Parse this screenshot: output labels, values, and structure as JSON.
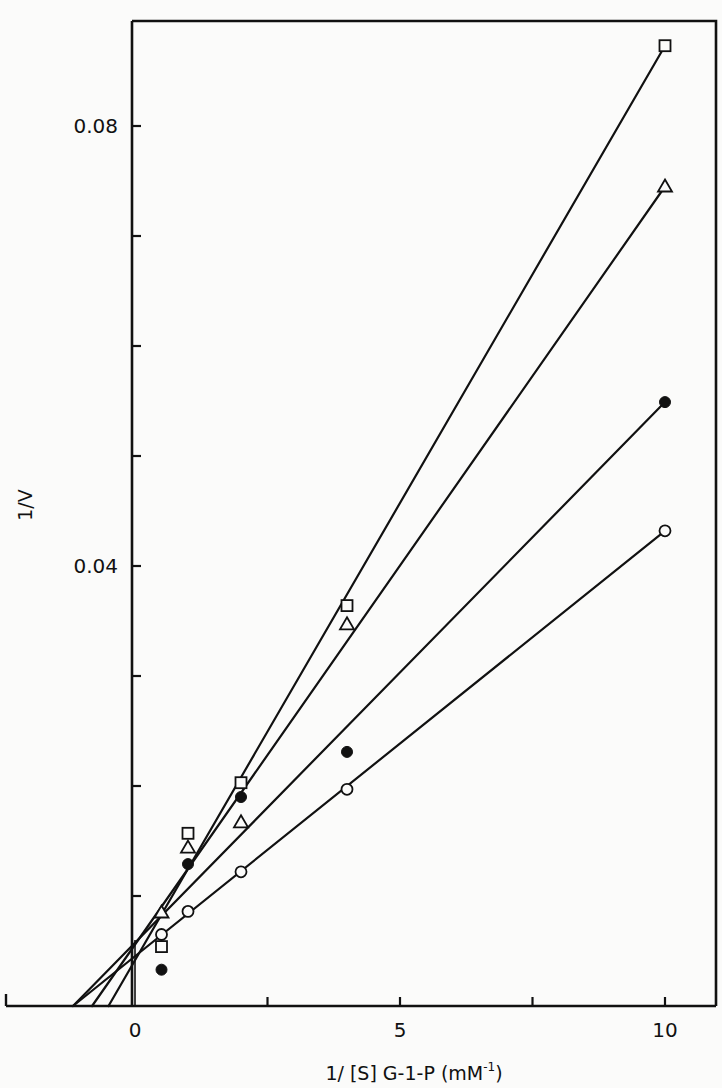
{
  "chart_data": {
    "type": "scatter",
    "title": "",
    "xlabel": "1/ [S]  G-1-P  (mM",
    "xlabel_sup": "-1",
    "xlabel_close": ")",
    "ylabel": "1/V",
    "xlim": [
      -2.45,
      10.95
    ],
    "ylim": [
      0,
      0.0895
    ],
    "grid": false,
    "legend": "none",
    "x_ticks": [
      {
        "value": 0,
        "label": "0"
      },
      {
        "value": 2.5,
        "label": ""
      },
      {
        "value": 5,
        "label": "5"
      },
      {
        "value": 7.5,
        "label": ""
      },
      {
        "value": 10,
        "label": "10"
      }
    ],
    "y_ticks": [
      {
        "value": 0.01,
        "label": ""
      },
      {
        "value": 0.02,
        "label": ""
      },
      {
        "value": 0.03,
        "label": ""
      },
      {
        "value": 0.04,
        "label": "0.04"
      },
      {
        "value": 0.05,
        "label": ""
      },
      {
        "value": 0.06,
        "label": ""
      },
      {
        "value": 0.07,
        "label": ""
      },
      {
        "value": 0.08,
        "label": "0.08"
      }
    ],
    "series": [
      {
        "name": "open-square",
        "marker": "square-open",
        "x": [
          0.5,
          1,
          2,
          4,
          10
        ],
        "y": [
          0.0054,
          0.0157,
          0.0203,
          0.0364,
          0.0873
        ],
        "fit_line": {
          "x": [
            -0.5,
            10
          ],
          "y": [
            0,
            0.0873
          ]
        }
      },
      {
        "name": "open-triangle",
        "marker": "triangle-open",
        "x": [
          0.5,
          1,
          2,
          4,
          10
        ],
        "y": [
          0.0085,
          0.0144,
          0.0167,
          0.0347,
          0.0745
        ],
        "fit_line": {
          "x": [
            -0.81,
            10
          ],
          "y": [
            0,
            0.0745
          ]
        }
      },
      {
        "name": "filled-circle",
        "marker": "circle-filled",
        "x": [
          0.5,
          1,
          2,
          4,
          10
        ],
        "y": [
          0.0033,
          0.0129,
          0.019,
          0.0231,
          0.0549
        ],
        "fit_line": {
          "x": [
            -1.17,
            10
          ],
          "y": [
            0,
            0.0549
          ]
        }
      },
      {
        "name": "open-circle",
        "marker": "circle-open",
        "x": [
          0.5,
          1,
          2,
          4,
          10
        ],
        "y": [
          0.0065,
          0.0086,
          0.0122,
          0.0197,
          0.0432
        ],
        "fit_line": {
          "x": [
            -1.17,
            10
          ],
          "y": [
            0,
            0.0432
          ]
        }
      }
    ]
  },
  "layout": {
    "ink_color": "#111111",
    "paper_color": "#fbfbfa",
    "x0_px": 135,
    "px_per_x": 53,
    "y0_px": 1006,
    "px_per_y": 11000,
    "frame": {
      "left": 132,
      "top": 21,
      "right": 716,
      "bottom": 1006
    },
    "xaxis_left_px": 6
  }
}
